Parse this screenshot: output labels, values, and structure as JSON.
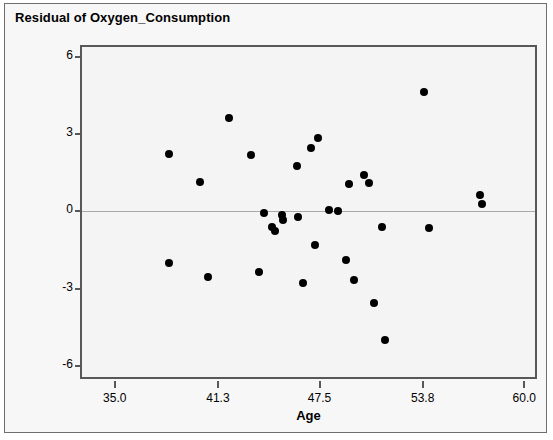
{
  "chart_data": {
    "type": "scatter",
    "title": "Residual of Oxygen_Consumption",
    "xlabel": "Age",
    "ylabel": "",
    "xlim": [
      33.0,
      60.9
    ],
    "ylim": [
      -6.6,
      6.4
    ],
    "xticks": [
      "35.0",
      "41.3",
      "47.5",
      "53.8",
      "60.0"
    ],
    "xtick_values": [
      35.0,
      41.3,
      47.5,
      53.8,
      60.0
    ],
    "yticks": [
      "6",
      "3",
      "0",
      "-3",
      "-6"
    ],
    "ytick_values": [
      6,
      3,
      0,
      -3,
      -6
    ],
    "grid": false,
    "legend": false,
    "reference_line": {
      "axis": "y",
      "value": 0,
      "color": "#a9a9a9"
    },
    "marker": {
      "shape": "circle",
      "color": "#000000",
      "size": 8
    },
    "x": [
      38.3,
      38.3,
      40.2,
      40.7,
      42.0,
      43.3,
      43.8,
      44.1,
      44.6,
      44.8,
      45.0,
      45.2,
      45.3,
      46.1,
      46.2,
      46.5,
      46.7,
      47.0,
      47.2,
      47.4,
      48.1,
      48.6,
      49.1,
      49.3,
      49.6,
      50.2,
      50.5,
      50.8,
      51.3,
      51.5,
      51.7,
      52.0,
      52.3,
      53.9,
      54.2,
      57.3,
      57.4
    ],
    "y": [
      2.25,
      -2.0,
      1.15,
      -2.55,
      3.65,
      2.2,
      -2.35,
      -0.05,
      -0.6,
      -0.75,
      -0.1,
      -0.15,
      -0.35,
      1.75,
      -0.2,
      -2.8,
      -0.35,
      2.45,
      -1.3,
      2.85,
      0.05,
      0.0,
      -1.9,
      1.05,
      -2.65,
      1.4,
      1.1,
      -3.55,
      -0.6,
      -5.0,
      -0.65,
      0.5,
      -0.6,
      4.65,
      -0.65,
      0.65,
      0.3
    ],
    "points": [
      {
        "x": 38.3,
        "y": 2.25
      },
      {
        "x": 38.3,
        "y": -2.0
      },
      {
        "x": 40.2,
        "y": 1.15
      },
      {
        "x": 40.7,
        "y": -2.55
      },
      {
        "x": 42.0,
        "y": 3.65
      },
      {
        "x": 43.3,
        "y": 2.2
      },
      {
        "x": 43.8,
        "y": -2.35
      },
      {
        "x": 44.1,
        "y": -0.05
      },
      {
        "x": 44.6,
        "y": -0.6
      },
      {
        "x": 44.8,
        "y": -0.75
      },
      {
        "x": 45.2,
        "y": -0.15
      },
      {
        "x": 45.3,
        "y": -0.35
      },
      {
        "x": 46.1,
        "y": 1.75
      },
      {
        "x": 46.2,
        "y": -0.2
      },
      {
        "x": 46.5,
        "y": -2.8
      },
      {
        "x": 47.0,
        "y": 2.45
      },
      {
        "x": 47.2,
        "y": -1.3
      },
      {
        "x": 47.4,
        "y": 2.85
      },
      {
        "x": 48.1,
        "y": 0.05
      },
      {
        "x": 48.6,
        "y": 0.0
      },
      {
        "x": 49.1,
        "y": -1.9
      },
      {
        "x": 49.3,
        "y": 1.05
      },
      {
        "x": 49.6,
        "y": -2.65
      },
      {
        "x": 50.2,
        "y": 1.4
      },
      {
        "x": 50.5,
        "y": 1.1
      },
      {
        "x": 50.8,
        "y": -3.55
      },
      {
        "x": 51.3,
        "y": -0.6
      },
      {
        "x": 51.5,
        "y": -5.0
      },
      {
        "x": 53.9,
        "y": 4.65
      },
      {
        "x": 54.2,
        "y": -0.65
      },
      {
        "x": 57.3,
        "y": 0.65
      },
      {
        "x": 57.4,
        "y": 0.3
      }
    ]
  }
}
